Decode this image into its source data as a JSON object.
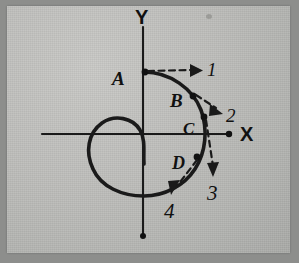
{
  "figure": {
    "background_color": "#b8b9b6",
    "ink_color": "#1a1a1a",
    "axes": {
      "y_axis_label": "Y",
      "x_axis_label": "X",
      "origin": {
        "x": 143,
        "y": 134
      },
      "x_axis": {
        "x_start": 42,
        "x_end": 236,
        "y": 134
      },
      "y_axis": {
        "x": 143,
        "y_start": 27,
        "y_end": 236
      }
    },
    "points": [
      {
        "label": "A",
        "label_x": 118,
        "label_y": 78,
        "marker_x": 144,
        "marker_y": 72
      },
      {
        "label": "B",
        "label_x": 171,
        "label_y": 100,
        "marker_x": 192,
        "marker_y": 96
      },
      {
        "label": "C",
        "label_x": 184,
        "label_y": 128,
        "marker_x": 203,
        "marker_y": 117
      },
      {
        "label": "D",
        "label_x": 174,
        "label_y": 163,
        "marker_x": 196,
        "marker_y": 157
      }
    ],
    "vectors": [
      {
        "label": "1",
        "label_x": 204,
        "label_y": 70,
        "from_x": 147,
        "from_y": 71,
        "to_x": 192,
        "to_y": 69,
        "description": "tangent at A pointing right"
      },
      {
        "label": "2",
        "label_x": 226,
        "label_y": 114,
        "from_x": 194,
        "from_y": 95,
        "to_x": 216,
        "to_y": 108,
        "description": "tangent at B pointing down-right"
      },
      {
        "label": "3",
        "label_x": 216,
        "label_y": 194,
        "from_x": 205,
        "from_y": 119,
        "to_x": 211,
        "to_y": 172,
        "description": "tangent at C pointing down"
      },
      {
        "label": "4",
        "label_x": 172,
        "label_y": 215,
        "from_x": 196,
        "from_y": 160,
        "to_x": 171,
        "to_y": 194,
        "description": "tangent at D pointing down-left"
      }
    ]
  }
}
